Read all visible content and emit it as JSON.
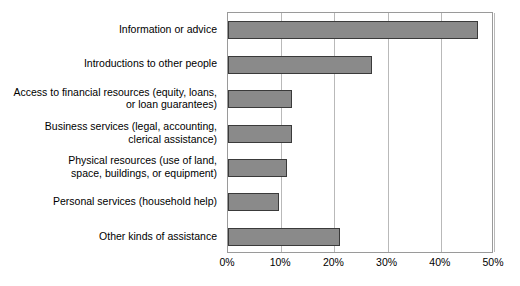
{
  "chart_data": {
    "type": "bar",
    "orientation": "horizontal",
    "title": "",
    "subtitle": "",
    "xlabel": "",
    "ylabel": "",
    "xlim": [
      0,
      50
    ],
    "grid": true,
    "legend": false,
    "tick_suffix": "%",
    "xticks": [
      "0%",
      "10%",
      "20%",
      "30%",
      "40%",
      "50%"
    ],
    "xtick_values": [
      0,
      10,
      20,
      30,
      40,
      50
    ],
    "categories": [
      "Information or advice",
      "Introductions to other people",
      "Access to financial resources (equity, loans,\nor loan guarantees)",
      "Business services (legal, accounting,\nclerical assistance)",
      "Physical resources (use of land,\nspace, buildings, or equipment)",
      "Personal services (household help)",
      "Other kinds of assistance"
    ],
    "values": [
      47,
      27,
      12,
      12,
      11,
      9.5,
      21
    ],
    "bar_color": "#8a8a8a",
    "bar_edge_color": "#3a3a3a",
    "grid_color": "#b9b9b9",
    "frame_color": "#9a9a9a"
  }
}
